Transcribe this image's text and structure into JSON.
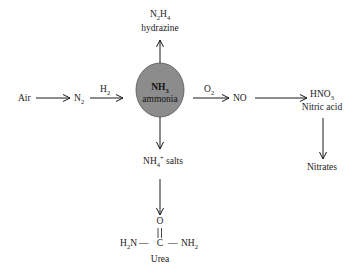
{
  "diagram": {
    "type": "ammonia-reaction-pathways",
    "center": {
      "formula": "NH",
      "formula_sub": "3",
      "name": "ammonia",
      "fill": "#8c8c8c"
    },
    "nodes": {
      "air": "Air",
      "n2": {
        "base": "N",
        "sub": "2"
      },
      "hydrazine": {
        "f1": "N",
        "s1": "2",
        "f2": "H",
        "s2": "4",
        "name": "hydrazine"
      },
      "no": "NO",
      "nitric": {
        "base": "HNO",
        "sub": "3",
        "name": "Nitric acid"
      },
      "nitrates": "Nitrates",
      "ammonium": {
        "base": "NH",
        "sub": "4",
        "sup": "+",
        "suffix": " salts"
      },
      "urea": {
        "o": "O",
        "left": {
          "base": "H",
          "sub": "2",
          "tail": "N"
        },
        "c": "C",
        "right": {
          "base": "NH",
          "sub": "2"
        },
        "dash": "—",
        "name": "Urea"
      }
    },
    "edge_labels": {
      "h2": {
        "base": "H",
        "sub": "2"
      },
      "o2": {
        "base": "O",
        "sub": "2"
      }
    },
    "edges": [
      {
        "from": "Air",
        "to": "N2"
      },
      {
        "from": "N2",
        "to": "NH3",
        "label": "H2"
      },
      {
        "from": "NH3",
        "to": "N2H4"
      },
      {
        "from": "NH3",
        "to": "NO",
        "label": "O2"
      },
      {
        "from": "NO",
        "to": "HNO3"
      },
      {
        "from": "HNO3",
        "to": "Nitrates"
      },
      {
        "from": "NH3",
        "to": "NH4+ salts"
      },
      {
        "from": "NH4+ salts",
        "to": "Urea"
      }
    ]
  }
}
